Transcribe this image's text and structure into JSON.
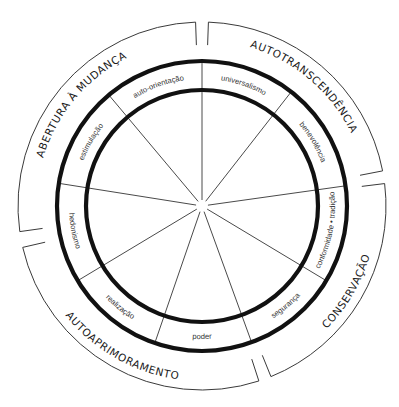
{
  "diagram": {
    "type": "circular value model",
    "center": [
      202,
      206
    ],
    "radii": {
      "outer_bracket": 184,
      "bracket_inner": 161,
      "outer_ring": 145,
      "inner_ring": 116
    },
    "spoke_angles_deg": [
      0,
      38,
      82,
      121,
      160,
      199,
      239,
      279,
      320
    ],
    "values": [
      {
        "id": "universalismo",
        "label": "universalismo",
        "angle": 19,
        "flip": false
      },
      {
        "id": "benevolencia",
        "label": "benevolência",
        "angle": 60,
        "flip": false
      },
      {
        "id": "conformidade-tradicao",
        "label": "conformidade • tradição",
        "angle": 101,
        "flip": true
      },
      {
        "id": "seguranca",
        "label": "segurança",
        "angle": 140,
        "flip": true
      },
      {
        "id": "poder",
        "label": "poder",
        "angle": 180,
        "flip": true
      },
      {
        "id": "realizacao",
        "label": "realização",
        "angle": 219,
        "flip": true
      },
      {
        "id": "hedonismo",
        "label": "hedonismo",
        "angle": 259,
        "flip": true
      },
      {
        "id": "estimulacao",
        "label": "estimulação",
        "angle": 300,
        "flip": false
      },
      {
        "id": "auto-orientacao",
        "label": "auto-orientação",
        "angle": 340,
        "flip": false
      }
    ],
    "groups": [
      {
        "id": "autotranscendencia",
        "label": "AUTOTRANSCENDÊNCIA",
        "start": 2,
        "end": 79,
        "flip": false
      },
      {
        "id": "conservacao",
        "label": "CONSERVAÇÃO",
        "start": 83,
        "end": 158,
        "flip": true
      },
      {
        "id": "autoaprimoramento",
        "label": "AUTOAPRIMORAMENTO",
        "start": 162,
        "end": 257,
        "flip": true
      },
      {
        "id": "abertura-a-mudanca",
        "label": "ABERTURA À MUDANÇA",
        "start": 262,
        "end": 358,
        "flip": false
      }
    ]
  }
}
